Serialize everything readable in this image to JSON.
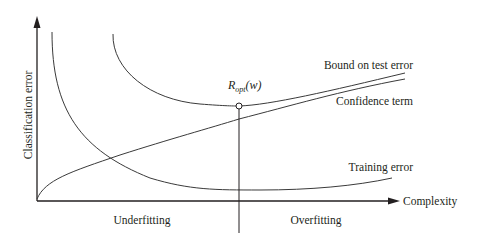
{
  "figure": {
    "type": "bias-variance / structural risk diagram",
    "y_axis": {
      "label": "Classification error"
    },
    "x_axis": {
      "label": "Complexity"
    },
    "curves": [
      {
        "id": "bound",
        "label": "Bound on test error",
        "shape": "U-shaped, decreasing then rising slightly"
      },
      {
        "id": "confidence",
        "label": "Confidence term",
        "shape": "monotonically increasing"
      },
      {
        "id": "training",
        "label": "Training error",
        "shape": "monotonically decreasing then flat/slight rise"
      }
    ],
    "optimum": {
      "label_main": "R",
      "label_sub": "opt",
      "label_arg": "(w)"
    },
    "regions": {
      "left": "Underfitting",
      "right": "Overfitting"
    }
  },
  "colors": {
    "ink": "#231f20",
    "curve": "#3a3a3a",
    "background": "#ffffff"
  }
}
